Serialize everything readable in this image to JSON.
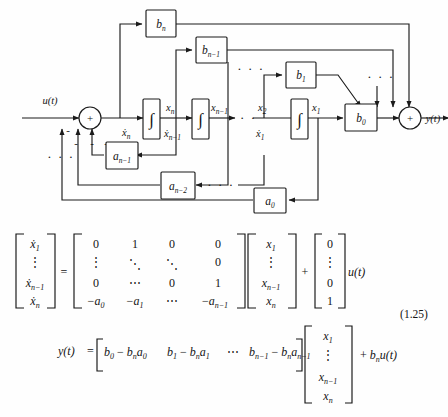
{
  "figure": {
    "kind": "control-system-block-diagram",
    "caption_number": "(1.25)"
  },
  "diagram": {
    "input_label": "u(t)",
    "output_label": "y(t)",
    "summer_input_sign": "+",
    "summer_output_sign": "+",
    "feedback_sign": "-",
    "ellipsis": "· · ·",
    "integral_glyph": "∫",
    "numerator_blocks": [
      {
        "name": "b-n-block",
        "label": "b",
        "sub": "n"
      },
      {
        "name": "b-n-1-block",
        "label": "b",
        "sub": "n−1"
      },
      {
        "name": "b-1-block",
        "label": "b",
        "sub": "1"
      },
      {
        "name": "b-0-block",
        "label": "b",
        "sub": "0"
      }
    ],
    "feedback_blocks": [
      {
        "name": "a-n-1-block",
        "label": "a",
        "sub": "n−1"
      },
      {
        "name": "a-n-2-block",
        "label": "a",
        "sub": "n−2"
      },
      {
        "name": "a-0-block",
        "label": "a",
        "sub": "0"
      }
    ],
    "integrators": [
      {
        "name": "integrator-n"
      },
      {
        "name": "integrator-n-1"
      },
      {
        "name": "integrator-1"
      }
    ],
    "signals": [
      {
        "name": "xdot-n",
        "label": "ẋ",
        "sub": "n"
      },
      {
        "name": "x-n",
        "label": "x",
        "sub": "n"
      },
      {
        "name": "xdot-n-1",
        "label": "ẋ",
        "sub": "n−1"
      },
      {
        "name": "x-n-1",
        "label": "x",
        "sub": "n−1"
      },
      {
        "name": "x-2",
        "label": "x",
        "sub": "2"
      },
      {
        "name": "xdot-1",
        "label": "ẋ",
        "sub": "1"
      },
      {
        "name": "x-1",
        "label": "x",
        "sub": "1"
      }
    ],
    "sign_marks": [
      "-",
      "-",
      "-",
      "-"
    ]
  },
  "equations": {
    "state_equation": {
      "lhs_vector": [
        "ẋ₁",
        "⋮",
        "ẋₙ₋₁",
        "ẋₙ"
      ],
      "lhs_items": [
        {
          "base": "x",
          "dot": true,
          "sub": "1"
        },
        {
          "base": "⋮",
          "dot": false,
          "sub": ""
        },
        {
          "base": "x",
          "dot": true,
          "sub": "n−1"
        },
        {
          "base": "x",
          "dot": true,
          "sub": "n"
        }
      ],
      "equals": "=",
      "matrix_rows": [
        [
          "0",
          "1",
          "0",
          "0"
        ],
        [
          "⋮",
          "⋱",
          "⋱",
          "0"
        ],
        [
          "0",
          "⋯",
          "0",
          "1"
        ],
        [
          "−a₀",
          "−a₁",
          "⋯",
          "−aₙ₋₁"
        ]
      ],
      "matrix_last_row_items": [
        {
          "sign": "−",
          "base": "a",
          "sub": "0"
        },
        {
          "sign": "−",
          "base": "a",
          "sub": "1"
        },
        {
          "sign": "",
          "base": "⋯",
          "sub": ""
        },
        {
          "sign": "−",
          "base": "a",
          "sub": "n−1"
        }
      ],
      "state_vector_items": [
        {
          "base": "x",
          "sub": "1"
        },
        {
          "base": "⋮",
          "sub": ""
        },
        {
          "base": "x",
          "sub": "n−1"
        },
        {
          "base": "x",
          "sub": "n"
        }
      ],
      "plus": "+",
      "input_vector": [
        "0",
        "⋮",
        "0",
        "1"
      ],
      "input_term": "u(t)"
    },
    "output_equation": {
      "lhs": "y(t)",
      "equals": "=",
      "row_items": [
        {
          "b": "b",
          "bsub": "0",
          "minus": "−",
          "bn": "b",
          "bnsub": "n",
          "a": "a",
          "asub": "0"
        },
        {
          "b": "b",
          "bsub": "1",
          "minus": "−",
          "bn": "b",
          "bnsub": "n",
          "a": "a",
          "asub": "1"
        },
        {
          "b": "⋯",
          "bsub": "",
          "minus": "",
          "bn": "",
          "bnsub": "",
          "a": "",
          "asub": ""
        },
        {
          "b": "b",
          "bsub": "n−1",
          "minus": "−",
          "bn": "b",
          "bnsub": "n",
          "a": "a",
          "asub": "n−1"
        }
      ],
      "state_vector_items": [
        {
          "base": "x",
          "sub": "1"
        },
        {
          "base": "⋮",
          "sub": ""
        },
        {
          "base": "x",
          "sub": "n−1"
        },
        {
          "base": "x",
          "sub": "n"
        }
      ],
      "plus": "+",
      "feedthrough": {
        "b": "b",
        "sub": "n",
        "u": "u(t)"
      }
    },
    "number": "(1.25)"
  },
  "colors": {
    "ink": "#1b1b1b",
    "paper": "#fefefe"
  }
}
